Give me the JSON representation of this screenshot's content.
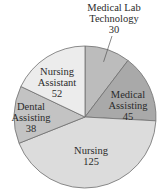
{
  "chart_data": {
    "type": "pie",
    "title": "",
    "start_angle": "12 o'clock",
    "direction": "clockwise",
    "slices": [
      {
        "label_lines": [
          "Medical Lab",
          "Technology"
        ],
        "label": "Medical Lab Technology",
        "value": 30,
        "color": "#bcbcbc",
        "label_outside": true
      },
      {
        "label_lines": [
          "Medical",
          "Assisting"
        ],
        "label": "Medical Assisting",
        "value": 45,
        "color": "#a9a9a9",
        "label_outside": false
      },
      {
        "label_lines": [
          "Nursing"
        ],
        "label": "Nursing",
        "value": 125,
        "color": "#dcdcdc",
        "label_outside": false
      },
      {
        "label_lines": [
          "Dental",
          "Assisting"
        ],
        "label": "Dental Assisting",
        "value": 38,
        "color": "#c3c3c3",
        "label_outside": false
      },
      {
        "label_lines": [
          "Nursing",
          "Assistant"
        ],
        "label": "Nursing Assistant",
        "value": 52,
        "color": "#ececec",
        "label_outside": false
      }
    ],
    "total": 290
  }
}
